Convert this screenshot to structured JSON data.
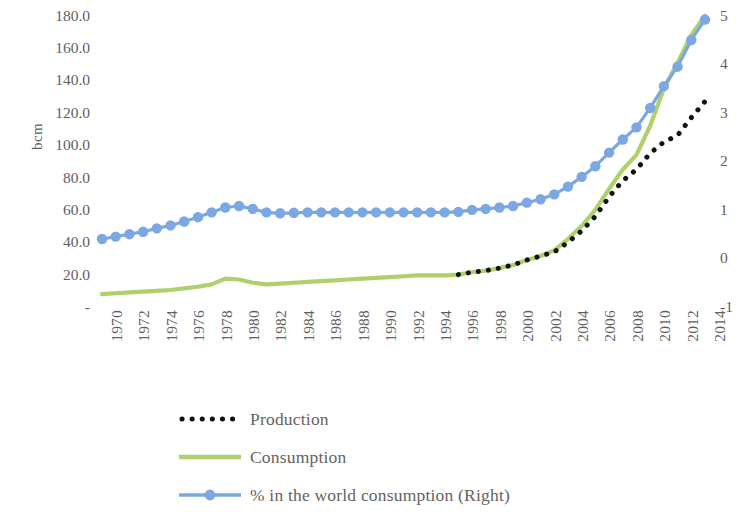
{
  "chart_data": {
    "type": "line",
    "title": "",
    "subtitle": "",
    "xlabel": "",
    "ylabel": "bcm",
    "y2label": "",
    "grid": false,
    "legend_position": "bottom-left",
    "x": [
      1970,
      1971,
      1972,
      1973,
      1974,
      1975,
      1976,
      1977,
      1978,
      1979,
      1980,
      1981,
      1982,
      1983,
      1984,
      1985,
      1986,
      1987,
      1988,
      1989,
      1990,
      1991,
      1992,
      1993,
      1994,
      1995,
      1996,
      1997,
      1998,
      1999,
      2000,
      2001,
      2002,
      2003,
      2004,
      2005,
      2006,
      2007,
      2008,
      2009,
      2010,
      2011,
      2012,
      2013,
      2014
    ],
    "xtick_labels": [
      "1970",
      "1972",
      "1974",
      "1976",
      "1978",
      "1980",
      "1982",
      "1984",
      "1986",
      "1988",
      "1990",
      "1992",
      "1994",
      "1996",
      "1998",
      "2000",
      "2002",
      "2004",
      "2006",
      "2008",
      "2010",
      "2012",
      "2014"
    ],
    "ytick_labels": [
      "180.0",
      "160.0",
      "140.0",
      "120.0",
      "100.0",
      "80.0",
      "60.0",
      "40.0",
      "20.0",
      "-"
    ],
    "ytick_values": [
      180,
      160,
      140,
      120,
      100,
      80,
      60,
      40,
      20,
      0
    ],
    "ylim": [
      0,
      186
    ],
    "y2tick_labels": [
      "5",
      "4",
      "3",
      "2",
      "1",
      "0",
      "-1"
    ],
    "y2tick_values": [
      5,
      4,
      3,
      2,
      1,
      0,
      -1
    ],
    "y2lim": [
      -1,
      5.2
    ],
    "series": [
      {
        "name": "Production",
        "axis": "left",
        "style": "dotted",
        "color": "#121212",
        "marker": "square-dot",
        "x": [
          1996,
          1997,
          1998,
          1999,
          2000,
          2001,
          2002,
          2003,
          2004,
          2005,
          2006,
          2007,
          2008,
          2009,
          2010,
          2011,
          2012,
          2013,
          2014
        ],
        "values": [
          20.0,
          21.5,
          22.5,
          24.0,
          26.0,
          29.0,
          31.5,
          34.0,
          40.0,
          47.0,
          56.0,
          68.0,
          78.0,
          85.0,
          95.0,
          102.0,
          106.0,
          117.0,
          127.0
        ]
      },
      {
        "name": "Consumption",
        "axis": "left",
        "style": "solid",
        "color": "#afd06a",
        "marker": "none",
        "x": [
          1970,
          1971,
          1972,
          1973,
          1974,
          1975,
          1976,
          1977,
          1978,
          1979,
          1980,
          1981,
          1982,
          1983,
          1984,
          1985,
          1986,
          1987,
          1988,
          1989,
          1990,
          1991,
          1992,
          1993,
          1994,
          1995,
          1996,
          1997,
          1998,
          1999,
          2000,
          2001,
          2002,
          2003,
          2004,
          2005,
          2006,
          2007,
          2008,
          2009,
          2010,
          2011,
          2012,
          2013,
          2014
        ],
        "values": [
          8.0,
          8.5,
          9.0,
          9.5,
          10.0,
          10.5,
          11.5,
          12.5,
          14.0,
          17.5,
          17.0,
          15.0,
          14.0,
          14.5,
          15.0,
          15.5,
          16.0,
          16.5,
          17.0,
          17.5,
          18.0,
          18.5,
          19.0,
          19.5,
          19.5,
          19.5,
          20.0,
          21.5,
          22.5,
          24.0,
          26.0,
          29.0,
          31.5,
          35.0,
          42.0,
          50.0,
          60.0,
          73.0,
          85.0,
          94.0,
          112.0,
          135.0,
          151.0,
          168.0,
          180.0
        ]
      },
      {
        "name": "% in the world consumption (Right)",
        "axis": "right",
        "style": "solid-marker",
        "color": "#7ba7e3",
        "marker": "circle",
        "x": [
          1970,
          1971,
          1972,
          1973,
          1974,
          1975,
          1976,
          1977,
          1978,
          1979,
          1980,
          1981,
          1982,
          1983,
          1984,
          1985,
          1986,
          1987,
          1988,
          1989,
          1990,
          1991,
          1992,
          1993,
          1994,
          1995,
          1996,
          1997,
          1998,
          1999,
          2000,
          2001,
          2002,
          2003,
          2004,
          2005,
          2006,
          2007,
          2008,
          2009,
          2010,
          2011,
          2012,
          2013,
          2014
        ],
        "values": [
          0.4,
          0.45,
          0.5,
          0.55,
          0.62,
          0.68,
          0.76,
          0.85,
          0.95,
          1.05,
          1.08,
          1.02,
          0.95,
          0.93,
          0.94,
          0.95,
          0.95,
          0.95,
          0.95,
          0.95,
          0.95,
          0.95,
          0.95,
          0.95,
          0.95,
          0.95,
          0.96,
          1.0,
          1.02,
          1.05,
          1.08,
          1.15,
          1.22,
          1.32,
          1.48,
          1.68,
          1.9,
          2.18,
          2.45,
          2.7,
          3.1,
          3.55,
          3.95,
          4.5,
          4.92
        ]
      }
    ]
  },
  "axis": {
    "y_title": "bcm"
  },
  "legend": {
    "items": [
      {
        "label": "Production",
        "key": "dotted-black",
        "color": "#121212"
      },
      {
        "label": "Consumption",
        "key": "solid-green",
        "color": "#afd06a"
      },
      {
        "label": "% in the world consumption (Right)",
        "key": "marker-blue",
        "color": "#7ba7e3"
      }
    ]
  }
}
